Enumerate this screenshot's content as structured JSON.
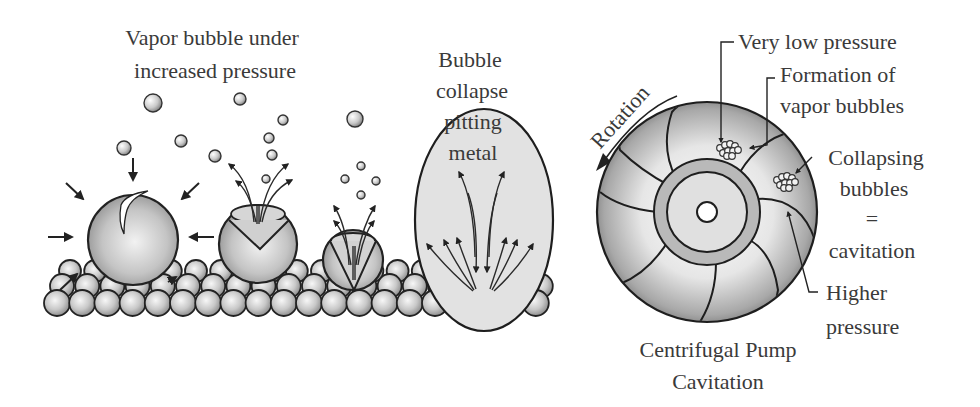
{
  "diagram": {
    "left_panel": {
      "title_line1": "Vapor bubble under",
      "title_line2": "increased pressure",
      "collapse_label": [
        "Bubble",
        "collapse",
        "pitting",
        "metal"
      ],
      "stages": [
        {
          "name": "vapor-bubble-compressed",
          "cx": 133,
          "cy": 240,
          "r": 45
        },
        {
          "name": "bubble-imploding",
          "cx": 258,
          "cy": 244,
          "r": 39
        },
        {
          "name": "bubble-microjet",
          "cx": 353,
          "cy": 260,
          "r": 30
        },
        {
          "name": "collapse-zone",
          "cx": 484,
          "cy": 220,
          "rx": 69,
          "ry": 111
        }
      ],
      "floating_bubbles": [
        {
          "cx": 153,
          "cy": 103,
          "r": 9
        },
        {
          "cx": 240,
          "cy": 99,
          "r": 6
        },
        {
          "cx": 124,
          "cy": 148,
          "r": 7
        },
        {
          "cx": 181,
          "cy": 141,
          "r": 6
        },
        {
          "cx": 215,
          "cy": 156,
          "r": 6
        },
        {
          "cx": 355,
          "cy": 119,
          "r": 8
        },
        {
          "cx": 283,
          "cy": 120,
          "r": 5
        },
        {
          "cx": 269,
          "cy": 138,
          "r": 5
        },
        {
          "cx": 272,
          "cy": 155,
          "r": 5
        },
        {
          "cx": 266,
          "cy": 179,
          "r": 4
        },
        {
          "cx": 361,
          "cy": 166,
          "r": 4
        },
        {
          "cx": 345,
          "cy": 179,
          "r": 4
        },
        {
          "cx": 376,
          "cy": 181,
          "r": 4
        },
        {
          "cx": 361,
          "cy": 195,
          "r": 4
        }
      ],
      "metal_surface": {
        "rows": [
          {
            "y": 303,
            "x_start": 57,
            "count": 20,
            "spacing": 25.2,
            "r": 13
          },
          {
            "y": 286,
            "x_start": 62,
            "count": 20,
            "spacing": 25.2,
            "r": 12
          },
          {
            "y": 271,
            "x_start": 70,
            "count": 19,
            "spacing": 25.2,
            "r": 11
          }
        ]
      }
    },
    "right_panel": {
      "rotation_label": "Rotation",
      "labels": {
        "very_low_pressure": "Very low pressure",
        "formation_line1": "Formation of",
        "formation_line2": "vapor bubbles",
        "collapsing_line1": "Collapsing",
        "collapsing_line2": "bubbles",
        "equals": "=",
        "cavitation": "cavitation",
        "higher_line1": "Higher",
        "higher_line2": "pressure"
      },
      "caption_line1": "Centrifugal Pump",
      "caption_line2": "Cavitation",
      "impeller": {
        "cx": 707,
        "cy": 212,
        "r_outer": 110,
        "r_hub_outer": 53,
        "r_hub_inner": 40,
        "r_eye": 10,
        "blade_count": 7
      }
    },
    "colors": {
      "ink": "#222222",
      "text": "#3a3a3a",
      "bubble_light": "#f4f4f4",
      "bubble_dark": "#8c8c8c",
      "collapse_fill": "#e2e2e2",
      "hub_ring": "#b9b9b9",
      "background": "#ffffff"
    }
  }
}
